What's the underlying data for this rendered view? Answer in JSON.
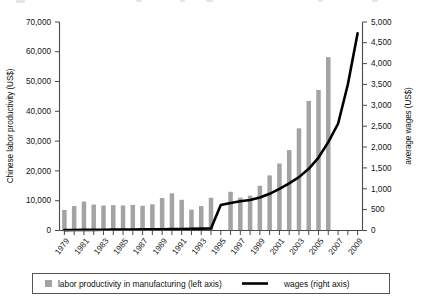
{
  "chart_data": {
    "type": "bar",
    "title": "",
    "subtitle": "",
    "xlabel": "",
    "ylabel": "Chinese labor productivity (US$)",
    "y2label": "average wages (US$)",
    "ylim": [
      0,
      70000
    ],
    "y2lim": [
      0,
      5000
    ],
    "grid": false,
    "legend_position": "bottom",
    "x": [
      1979,
      1980,
      1981,
      1982,
      1983,
      1984,
      1985,
      1986,
      1987,
      1988,
      1989,
      1990,
      1991,
      1992,
      1993,
      1994,
      1995,
      1996,
      1997,
      1998,
      1999,
      2000,
      2001,
      2002,
      2003,
      2004,
      2005,
      2006,
      2007,
      2008,
      2009
    ],
    "x_tick_labels": [
      "1979",
      "1981",
      "1983",
      "1985",
      "1987",
      "1989",
      "1991",
      "1993",
      "1995",
      "1997",
      "1999",
      "2001",
      "2003",
      "2005",
      "2007",
      "2009"
    ],
    "y_tick_labels": [
      "0",
      "10,000",
      "20,000",
      "30,000",
      "40,000",
      "50,000",
      "60,000",
      "70,000"
    ],
    "y2_tick_labels": [
      "0",
      "500",
      "1,000",
      "1,500",
      "2,000",
      "2,500",
      "3,000",
      "3,500",
      "4,000",
      "4,500",
      "5,000"
    ],
    "series": [
      {
        "name": "labor productivity in manufacturing (left axis)",
        "type": "bar",
        "axis": "left",
        "color": "#a3a3a3",
        "units": "US$",
        "values": [
          6900,
          8200,
          9700,
          8700,
          8400,
          8500,
          8400,
          8600,
          8300,
          8800,
          10900,
          12500,
          10300,
          7000,
          8200,
          11000,
          0,
          13000,
          11000,
          11700,
          15000,
          18500,
          22500,
          27000,
          34300,
          43500,
          47200,
          58200,
          0,
          0,
          0
        ]
      },
      {
        "name": "wages (right axis)",
        "type": "line",
        "axis": "right",
        "color": "#000000",
        "units": "US$",
        "values": [
          10,
          12,
          14,
          16,
          18,
          20,
          22,
          24,
          26,
          28,
          30,
          33,
          36,
          40,
          45,
          50,
          610,
          660,
          700,
          730,
          790,
          880,
          1000,
          1130,
          1280,
          1480,
          1750,
          2120,
          2560,
          3500,
          4730
        ]
      }
    ]
  },
  "legend": {
    "entries": [
      {
        "label": "labor productivity in manufacturing (left axis)",
        "marker": "square-swatch"
      },
      {
        "label": "wages (right axis)",
        "marker": "line-rule"
      }
    ]
  },
  "colors": {
    "bar": "#a3a3a3",
    "line": "#000000",
    "axis": "#4a4a4a",
    "background": "#ffffff"
  }
}
